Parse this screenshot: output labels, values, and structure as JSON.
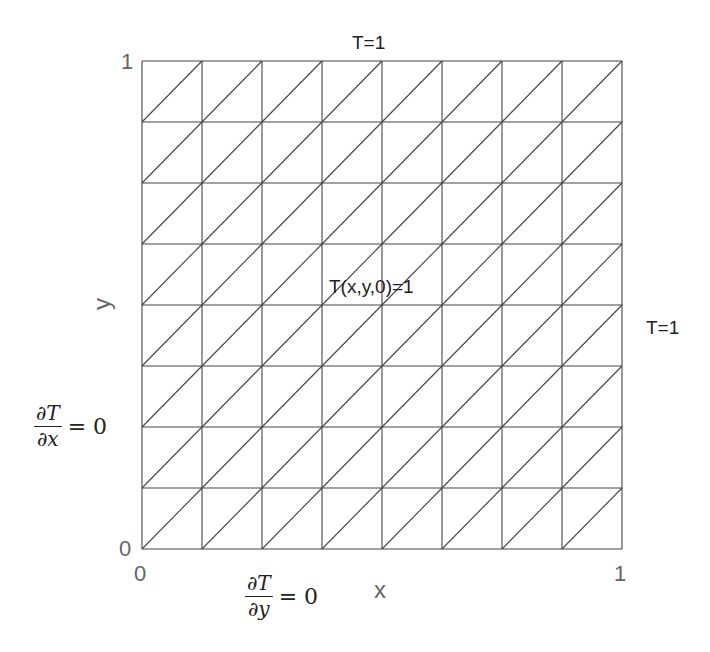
{
  "diagram": {
    "type": "triangular-mesh",
    "domain": {
      "x_min": 0,
      "x_max": 1,
      "y_min": 0,
      "y_max": 1
    },
    "grid": {
      "columns": 8,
      "rows": 8,
      "diagonal": "bottom-left-to-top-right"
    },
    "colors": {
      "mesh_line": "#444444",
      "tick_label": "#666666",
      "text": "#222222"
    }
  },
  "labels": {
    "top_boundary": "T=1",
    "right_boundary": "T=1",
    "initial_condition": "T(x,y,0)=1",
    "left_boundary": {
      "numerator": "∂T",
      "denominator": "∂x",
      "rhs": "= 0"
    },
    "bottom_boundary": {
      "numerator": "∂T",
      "denominator": "∂y",
      "rhs": "= 0"
    }
  },
  "axes": {
    "xlabel": "x",
    "ylabel": "y",
    "x_ticks": [
      "0",
      "1"
    ],
    "y_ticks": [
      "0",
      "1"
    ]
  }
}
